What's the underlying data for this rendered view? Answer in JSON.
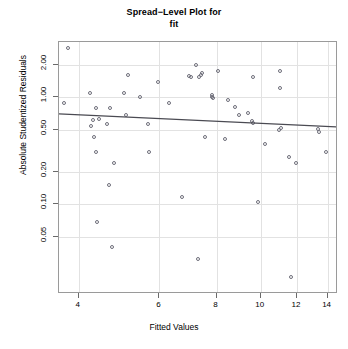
{
  "chart_data": {
    "type": "scatter",
    "title": "Spread−Level Plot for\nfit",
    "title_line1": "Spread−Level Plot for",
    "title_line2": "fit",
    "xlabel": "Fitted Values",
    "ylabel": "Absolute Studentized Residuals",
    "xscale": "log",
    "yscale": "log",
    "xlim": [
      3.62,
      14.75
    ],
    "ylim": [
      0.0145,
      3.3
    ],
    "grid": true,
    "legend": "none",
    "xticks": [
      4,
      6,
      8,
      10,
      12,
      14
    ],
    "xticklabels": [
      "4",
      "6",
      "8",
      "10",
      "12",
      "14"
    ],
    "yticks": [
      2.0,
      1.0,
      0.5,
      0.2,
      0.1,
      0.05
    ],
    "yticklabels": [
      "2.00",
      "1.00",
      "0.50",
      "0.20",
      "0.10",
      "0.05"
    ],
    "point_marker": "open-circle",
    "point_color": "#6e6e7a",
    "line_color": "#4a4a52",
    "fit_line": {
      "label": "spread-level fit",
      "x_start": 3.62,
      "y_start": 0.702,
      "x_end": 14.75,
      "y_end": 0.53
    },
    "x": [
      3.78,
      3.72,
      4.24,
      4.26,
      4.32,
      4.35,
      4.36,
      4.3,
      4.38,
      4.42,
      4.62,
      4.66,
      4.68,
      4.72,
      4.78,
      5.02,
      5.08,
      5.12,
      5.45,
      5.66,
      5.7,
      5.95,
      6.3,
      6.72,
      6.95,
      7.05,
      7.2,
      7.28,
      7.32,
      7.4,
      7.45,
      7.55,
      7.8,
      7.82,
      7.85,
      8.05,
      8.35,
      8.48,
      8.8,
      8.95,
      9.38,
      9.55,
      9.6,
      9.62,
      9.88,
      10.2,
      10.95,
      11.0,
      11.02,
      11.08,
      11.55,
      11.62,
      11.95,
      13.35,
      13.42,
      13.9
    ],
    "y": [
      2.9,
      0.88,
      1.11,
      0.545,
      0.425,
      0.31,
      0.8,
      0.62,
      0.068,
      0.63,
      0.56,
      0.152,
      0.8,
      0.04,
      0.242,
      1.105,
      0.69,
      1.64,
      1.02,
      0.56,
      0.31,
      1.39,
      0.89,
      0.118,
      1.58,
      1.56,
      2.01,
      0.031,
      1.565,
      1.64,
      1.7,
      0.43,
      1.05,
      1.02,
      0.995,
      1.76,
      0.405,
      0.945,
      0.82,
      0.69,
      0.72,
      0.6,
      0.575,
      1.54,
      0.105,
      0.37,
      0.5,
      1.76,
      1.235,
      0.515,
      0.278,
      0.021,
      0.242,
      0.505,
      0.48,
      0.31
    ]
  }
}
